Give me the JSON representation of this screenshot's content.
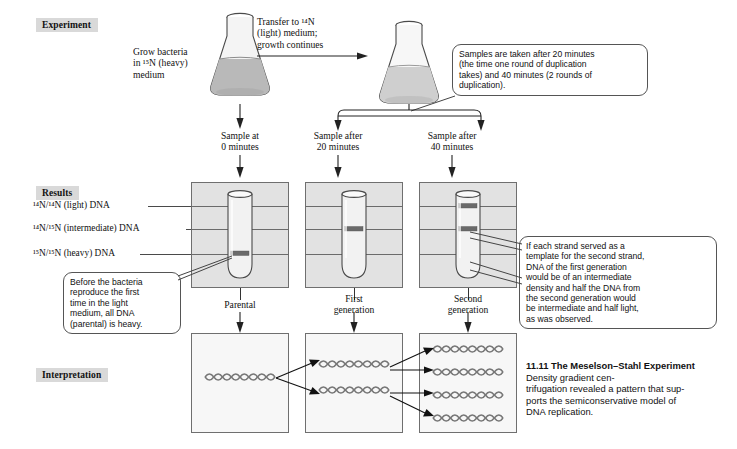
{
  "sections": {
    "experiment": "Experiment",
    "results": "Results",
    "interpretation": "Interpretation"
  },
  "experiment": {
    "grow_label": "Grow bacteria\nin ¹⁵N (heavy)\nmedium",
    "transfer_label": "Transfer to ¹⁴N\n(light) medium;\ngrowth continues",
    "samples_callout": "Samples are taken after 20 minutes\n(the time one round of duplication\ntakes) and 40 minutes (2 rounds of\nduplication).",
    "sample_labels": [
      "Sample at\n0 minutes",
      "Sample after\n20 minutes",
      "Sample after\n40 minutes"
    ]
  },
  "results": {
    "density_rows": [
      "¹⁴N/¹⁴N (light) DNA",
      "¹⁴N/¹⁵N (intermediate) DNA",
      "¹⁵N/¹⁵N (heavy) DNA"
    ],
    "generation_labels": [
      "Parental",
      "First\ngeneration",
      "Second\ngeneration"
    ],
    "left_callout": "Before the bacteria\nreproduce the first\ntime in the light\nmedium, all DNA\n(parental) is heavy.",
    "right_callout": "If each strand served as a\ntemplate for the second strand,\nDNA of the first generation\nwould be of an intermediate\ndensity and half the DNA from\nthe second generation would\nbe intermediate and half light,\nas was observed.",
    "bands": {
      "parental": [
        "heavy"
      ],
      "first_generation": [
        "intermediate"
      ],
      "second_generation": [
        "light",
        "intermediate"
      ]
    }
  },
  "interpretation": {
    "helix_counts": [
      1,
      2,
      4
    ]
  },
  "caption": {
    "number": "11.11",
    "title": "The Meselson–Stahl",
    "title2": "Experiment",
    "body": "Density gradient cen-\ntrifugation revealed a pattern that sup-\nports the semiconservative model of\nDNA replication."
  },
  "colors": {
    "section_label_bg": "#d9d9d9",
    "panel_bg": "#e2e2e2",
    "interp_panel_bg": "#f7f7f7",
    "medium_heavy": "#b9b9b9",
    "medium_light": "#cfcfcf",
    "band": "#6a6a6a",
    "outline": "#4a4a4a"
  }
}
